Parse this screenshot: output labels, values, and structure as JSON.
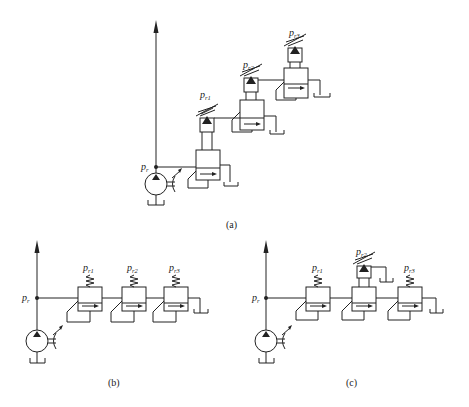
{
  "figure": {
    "panels": [
      {
        "id": "a",
        "caption": "(a)",
        "description": "Relief valves with remote pilot control connected in cascade (stepped)",
        "system_pressure_label": "p",
        "system_pressure_sub": "r",
        "valves": [
          {
            "label": "p",
            "sub": "r1",
            "type": "pilot-operated"
          },
          {
            "label": "p",
            "sub": "r2",
            "type": "pilot-operated"
          },
          {
            "label": "p",
            "sub": "r3",
            "type": "pilot-operated"
          }
        ]
      },
      {
        "id": "b",
        "caption": "(b)",
        "description": "Three direct relief valves in series",
        "system_pressure_label": "p",
        "system_pressure_sub": "r",
        "valves": [
          {
            "label": "p",
            "sub": "r1",
            "type": "direct"
          },
          {
            "label": "p",
            "sub": "r2",
            "type": "direct"
          },
          {
            "label": "p",
            "sub": "r3",
            "type": "direct"
          }
        ]
      },
      {
        "id": "c",
        "caption": "(c)",
        "description": "Series relief valves with middle valve pilot-operated",
        "system_pressure_label": "p",
        "system_pressure_sub": "r",
        "valves": [
          {
            "label": "p",
            "sub": "r1",
            "type": "direct"
          },
          {
            "label": "p",
            "sub": "r2",
            "type": "pilot-operated"
          },
          {
            "label": "p",
            "sub": "r3",
            "type": "direct"
          }
        ]
      }
    ],
    "symbols": {
      "pump": "variable-displacement-pump-icon",
      "tank": "tank-icon",
      "spring": "adjustable-spring-icon",
      "valve": "relief-valve-icon"
    },
    "colors": {
      "line": "#222222",
      "background": "#ffffff"
    }
  }
}
